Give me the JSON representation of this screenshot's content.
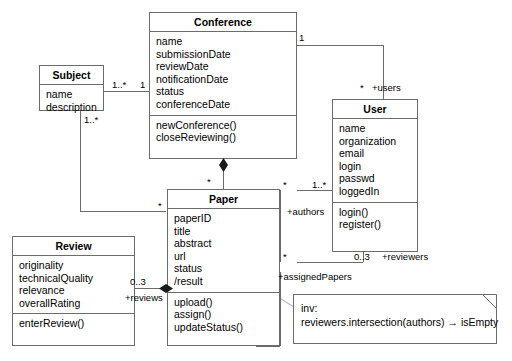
{
  "diagram": {
    "line_color": "#6b6b6b",
    "text_color": "#000000"
  },
  "classes": {
    "conference": {
      "name": "Conference",
      "attributes": [
        "name",
        "submissionDate",
        "reviewDate",
        "notificationDate",
        "status",
        "conferenceDate"
      ],
      "operations": [
        "newConference()",
        "closeReviewing()"
      ]
    },
    "subject": {
      "name": "Subject",
      "attributes": [
        "name",
        "description"
      ],
      "operations": []
    },
    "user": {
      "name": "User",
      "attributes": [
        "name",
        "organization",
        "email",
        "login",
        "passwd",
        "loggedIn"
      ],
      "operations": [
        "login()",
        "register()"
      ]
    },
    "paper": {
      "name": "Paper",
      "attributes": [
        "paperID",
        "title",
        "abstract",
        "url",
        "status",
        " /result"
      ],
      "operations": [
        "upload()",
        "assign()",
        "updateStatus()"
      ]
    },
    "review": {
      "name": "Review",
      "attributes": [
        "originality",
        "technicalQuality",
        "relevance",
        "overallRating"
      ],
      "operations": [
        "enterReview()"
      ]
    }
  },
  "associations": {
    "subject_conference": {
      "subject_end_multiplicity": "1..*",
      "conference_end_multiplicity": "1"
    },
    "subject_paper": {
      "subject_end_multiplicity": "1..*",
      "paper_end_multiplicity": "*"
    },
    "conference_user": {
      "conference_end_multiplicity": "1",
      "user_end_multiplicity": "*",
      "user_role": "+users"
    },
    "conference_paper": {
      "paper_end_multiplicity": "*"
    },
    "paper_authors": {
      "paper_end_multiplicity": "*",
      "user_end_multiplicity": "1..*",
      "role": "+authors"
    },
    "paper_reviewers": {
      "paper_end_multiplicity": "*",
      "user_end_multiplicity": "0..3",
      "reviewers_role": "+reviewers",
      "assigned_role": "+assignedPapers"
    },
    "review_paper": {
      "review_end_multiplicity": "0..3",
      "role": "+reviews"
    }
  },
  "note": {
    "line1": "inv:",
    "line2": "reviewers.intersection(authors) → isEmpty"
  }
}
